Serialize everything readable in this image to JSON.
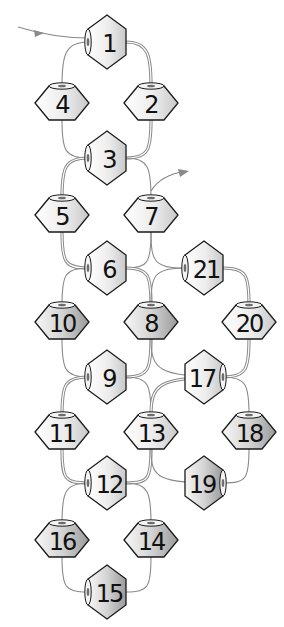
{
  "diagram": {
    "colors": {
      "thread": "#8a8a8a",
      "bead_outline": "#1a1a1a",
      "bead_light": "#ffffff",
      "bead_mid": "#dcdcdc",
      "bead_dark": "#9a9a9a",
      "label": "#111111"
    },
    "start_arrow": {
      "from": [
        18,
        27
      ],
      "to": [
        92,
        38
      ],
      "label": "thread start"
    },
    "end_arrow": {
      "from": [
        151,
        191
      ],
      "to": [
        186,
        171
      ],
      "label": "thread exit"
    },
    "beads": [
      {
        "id": "1",
        "label": "1",
        "x": 107,
        "y": 42,
        "orientation": "vertical",
        "hole": "left",
        "shade": "light"
      },
      {
        "id": "2",
        "label": "2",
        "x": 151,
        "y": 103,
        "orientation": "horizontal",
        "hole": "top",
        "shade": "light"
      },
      {
        "id": "3",
        "label": "3",
        "x": 107,
        "y": 158,
        "orientation": "vertical",
        "hole": "left",
        "shade": "light"
      },
      {
        "id": "4",
        "label": "4",
        "x": 62,
        "y": 103,
        "orientation": "horizontal",
        "hole": "top",
        "shade": "light"
      },
      {
        "id": "5",
        "label": "5",
        "x": 62,
        "y": 215,
        "orientation": "horizontal",
        "hole": "top",
        "shade": "light"
      },
      {
        "id": "6",
        "label": "6",
        "x": 107,
        "y": 268,
        "orientation": "vertical",
        "hole": "left",
        "shade": "light"
      },
      {
        "id": "7",
        "label": "7",
        "x": 151,
        "y": 215,
        "orientation": "horizontal",
        "hole": "top",
        "shade": "light"
      },
      {
        "id": "8",
        "label": "8",
        "x": 151,
        "y": 322,
        "orientation": "horizontal",
        "hole": "top",
        "shade": "dark"
      },
      {
        "id": "9",
        "label": "9",
        "x": 107,
        "y": 377,
        "orientation": "vertical",
        "hole": "left",
        "shade": "light"
      },
      {
        "id": "10",
        "label": "10",
        "x": 62,
        "y": 322,
        "orientation": "horizontal",
        "hole": "top",
        "shade": "dark"
      },
      {
        "id": "11",
        "label": "11",
        "x": 62,
        "y": 432,
        "orientation": "horizontal",
        "hole": "top",
        "shade": "light"
      },
      {
        "id": "12",
        "label": "12",
        "x": 107,
        "y": 483,
        "orientation": "vertical",
        "hole": "left",
        "shade": "light"
      },
      {
        "id": "13",
        "label": "13",
        "x": 151,
        "y": 432,
        "orientation": "horizontal",
        "hole": "top",
        "shade": "light"
      },
      {
        "id": "14",
        "label": "14",
        "x": 151,
        "y": 540,
        "orientation": "horizontal",
        "hole": "top",
        "shade": "dark"
      },
      {
        "id": "15",
        "label": "15",
        "x": 107,
        "y": 592,
        "orientation": "vertical",
        "hole": "left",
        "shade": "dark"
      },
      {
        "id": "16",
        "label": "16",
        "x": 62,
        "y": 540,
        "orientation": "horizontal",
        "hole": "top",
        "shade": "dark"
      },
      {
        "id": "17",
        "label": "17",
        "x": 204,
        "y": 377,
        "orientation": "vertical",
        "hole": "right",
        "shade": "light"
      },
      {
        "id": "18",
        "label": "18",
        "x": 249,
        "y": 432,
        "orientation": "horizontal",
        "hole": "top",
        "shade": "dark"
      },
      {
        "id": "19",
        "label": "19",
        "x": 204,
        "y": 483,
        "orientation": "vertical",
        "hole": "right",
        "shade": "dark"
      },
      {
        "id": "20",
        "label": "20",
        "x": 249,
        "y": 322,
        "orientation": "horizontal",
        "hole": "top",
        "shade": "light"
      },
      {
        "id": "21",
        "label": "21",
        "x": 204,
        "y": 268,
        "orientation": "vertical",
        "hole": "left",
        "shade": "light"
      }
    ],
    "threads": [
      {
        "from": "1",
        "to": "4",
        "double": false
      },
      {
        "from": "1",
        "to": "2",
        "double": true
      },
      {
        "from": "4",
        "to": "3",
        "double": false
      },
      {
        "from": "2",
        "to": "3",
        "double": true
      },
      {
        "from": "3",
        "to": "5",
        "double": true
      },
      {
        "from": "3",
        "to": "7",
        "double": false
      },
      {
        "from": "5",
        "to": "6",
        "double": true
      },
      {
        "from": "7",
        "to": "6",
        "double": false
      },
      {
        "from": "7",
        "to": "21",
        "double": false
      },
      {
        "from": "6",
        "to": "10",
        "double": false
      },
      {
        "from": "6",
        "to": "8",
        "double": true
      },
      {
        "from": "21",
        "to": "8",
        "double": false
      },
      {
        "from": "21",
        "to": "20",
        "double": true
      },
      {
        "from": "10",
        "to": "9",
        "double": false
      },
      {
        "from": "8",
        "to": "9",
        "double": true
      },
      {
        "from": "8",
        "to": "17",
        "double": false
      },
      {
        "from": "20",
        "to": "17",
        "double": true
      },
      {
        "from": "9",
        "to": "11",
        "double": true
      },
      {
        "from": "9",
        "to": "13",
        "double": false
      },
      {
        "from": "17",
        "to": "13",
        "double": true
      },
      {
        "from": "17",
        "to": "18",
        "double": false
      },
      {
        "from": "11",
        "to": "12",
        "double": true
      },
      {
        "from": "13",
        "to": "12",
        "double": true
      },
      {
        "from": "13",
        "to": "19",
        "double": false
      },
      {
        "from": "18",
        "to": "19",
        "double": false
      },
      {
        "from": "12",
        "to": "16",
        "double": false
      },
      {
        "from": "12",
        "to": "14",
        "double": false
      },
      {
        "from": "16",
        "to": "15",
        "double": false
      },
      {
        "from": "14",
        "to": "15",
        "double": false
      }
    ]
  }
}
